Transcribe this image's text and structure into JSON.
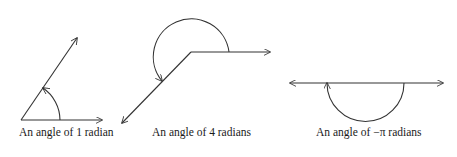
{
  "figures": [
    {
      "label": "An angle of 1 radian",
      "angle": "1 radian"
    },
    {
      "label": "An angle of 4 radians",
      "angle": "4 radians"
    },
    {
      "label": "An angle of −π radians",
      "angle": "-pi radians"
    }
  ],
  "colors": {
    "stroke": "#333333",
    "background": "#ffffff"
  }
}
